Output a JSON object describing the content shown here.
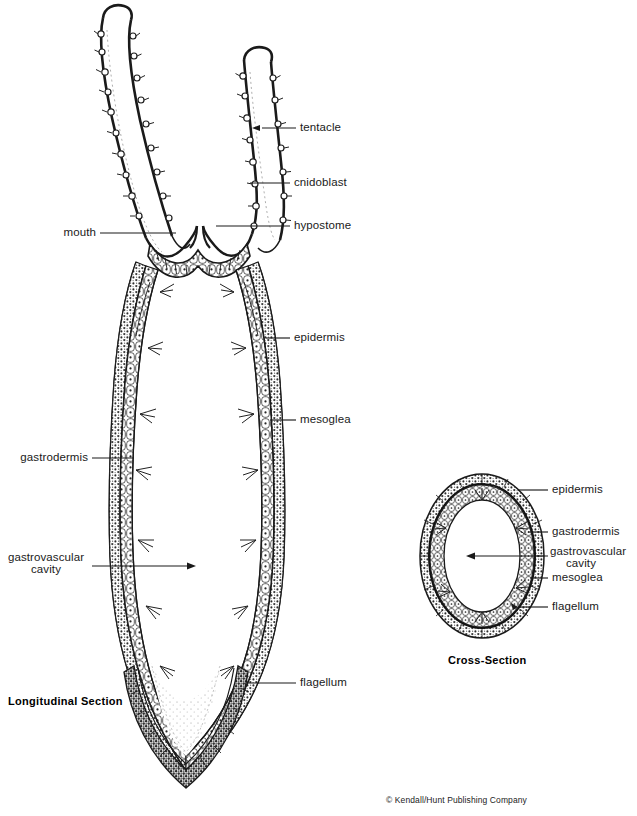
{
  "figure": {
    "title_longitudinal": "Longitudinal  Section",
    "title_cross": "Cross-Section",
    "copyright": "© Kendall/Hunt Publishing Company"
  },
  "longitudinal_labels": {
    "tentacle": "tentacle",
    "cnidoblast": "cnidoblast",
    "hypostome": "hypostome",
    "mouth": "mouth",
    "epidermis": "epidermis",
    "mesoglea": "mesoglea",
    "gastrodermis": "gastrodermis",
    "gastrovascular_line1": "gastrovascular",
    "gastrovascular_line2": "cavity",
    "flagellum": "flagellum"
  },
  "cross_labels": {
    "epidermis": "epidermis",
    "gastrodermis": "gastrodermis",
    "gastrovascular_line1": "gastrovascular",
    "gastrovascular_line2": "cavity",
    "mesoglea": "mesoglea",
    "flagellum": "flagellum"
  },
  "colors": {
    "ink": "#111111",
    "background": "#ffffff",
    "cell_fill": "#ffffff",
    "dense_fill": "#6b6b6b"
  }
}
